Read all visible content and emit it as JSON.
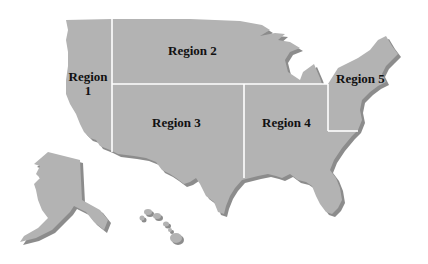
{
  "map": {
    "title": "",
    "colors": {
      "land": "#b3b3b3",
      "shadow": "#8c8c8c",
      "divider": "#ffffff",
      "background": "#ffffff",
      "label": "#111111"
    },
    "regions": [
      {
        "id": 1,
        "label_line1": "Region",
        "label_line2": "1"
      },
      {
        "id": 2,
        "label": "Region 2"
      },
      {
        "id": 3,
        "label": "Region 3"
      },
      {
        "id": 4,
        "label": "Region 4"
      },
      {
        "id": 5,
        "label": "Region 5"
      }
    ],
    "insets": [
      "Alaska",
      "Hawaii"
    ]
  }
}
